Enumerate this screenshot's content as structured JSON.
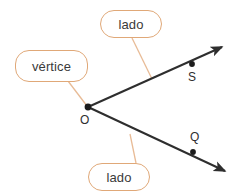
{
  "canvas": {
    "width": 240,
    "height": 193,
    "background": "#ffffff"
  },
  "palette": {
    "callout_border": "#e0a878",
    "callout_fill": "#ffffff",
    "connector": "#e8bb96",
    "text": "#3a3a3a",
    "geometry_stroke": "#2e2e2e",
    "point_fill": "#1c1c1c"
  },
  "callouts": [
    {
      "id": "vertice",
      "label": "vértice",
      "box": {
        "x": 15,
        "y": 50,
        "width": 73,
        "height": 32
      },
      "connector": {
        "x1": 68,
        "y1": 81,
        "x2": 87,
        "y2": 106
      }
    },
    {
      "id": "lado-top",
      "label": "lado",
      "box": {
        "x": 100,
        "y": 10,
        "width": 62,
        "height": 28
      },
      "connector": {
        "x1": 132,
        "y1": 38,
        "x2": 152,
        "y2": 79
      }
    },
    {
      "id": "lado-bottom",
      "label": "lado",
      "box": {
        "x": 88,
        "y": 163,
        "width": 62,
        "height": 28
      },
      "connector": {
        "x1": 136,
        "y1": 163,
        "x2": 130,
        "y2": 134
      }
    }
  ],
  "geometry": {
    "vertex": {
      "name": "O",
      "x": 88,
      "y": 107,
      "label_x": 80,
      "label_y": 114
    },
    "rays": [
      {
        "id": "ray-OS",
        "from": {
          "x": 88,
          "y": 107
        },
        "to": {
          "x": 226,
          "y": 45
        },
        "point": {
          "name": "S",
          "x": 192,
          "y": 64,
          "label_x": 188,
          "label_y": 71
        }
      },
      {
        "id": "ray-OQ",
        "from": {
          "x": 88,
          "y": 107
        },
        "to": {
          "x": 229,
          "y": 173
        },
        "point": {
          "name": "Q",
          "x": 193,
          "y": 152,
          "label_x": 190,
          "label_y": 131
        }
      }
    ]
  }
}
